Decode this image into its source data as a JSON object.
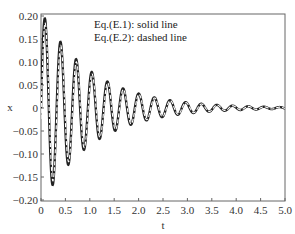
{
  "chart_data": {
    "type": "line",
    "title": "",
    "xlabel": "t",
    "ylabel": "x",
    "xlim": [
      0,
      5.0
    ],
    "ylim": [
      -0.2,
      0.2
    ],
    "x_ticks": [
      "0",
      "0.5",
      "1.0",
      "1.5",
      "2.0",
      "2.5",
      "3.0",
      "3.5",
      "4.0",
      "4.5",
      "5.0"
    ],
    "y_ticks": [
      "0.20",
      "0.15",
      "0.10",
      "0.05",
      "0",
      "−0.05",
      "−0.10",
      "−0.15",
      "−0.20"
    ],
    "grid": false,
    "legend_position": "top-center (text annotation)",
    "annotations": [
      "Eq.(E.1): solid line",
      "Eq.(E.2): dashed line"
    ],
    "series": [
      {
        "name": "Eq.(E.1)",
        "style": "solid",
        "model": "x(t) = A*exp(-zeta*t)*sin(omega*t)",
        "A": 0.21,
        "zeta": 0.95,
        "omega": 19.6,
        "key_points": [
          [
            0,
            0
          ],
          [
            0.08,
            0.185
          ],
          [
            0.25,
            -0.16
          ],
          [
            0.4,
            0.135
          ],
          [
            0.57,
            -0.115
          ],
          [
            0.73,
            0.1
          ],
          [
            0.89,
            -0.085
          ],
          [
            1.05,
            0.07
          ],
          [
            1.21,
            -0.06
          ],
          [
            1.37,
            0.05
          ],
          [
            1.53,
            -0.045
          ],
          [
            1.7,
            0.037
          ],
          [
            2.5,
            0.015
          ],
          [
            3.5,
            0.005
          ],
          [
            5.0,
            0.001
          ]
        ]
      },
      {
        "name": "Eq.(E.2)",
        "style": "dashed",
        "model": "x(t) = A*exp(-zeta*t)*sin(omega*t + phase)",
        "A": 0.2,
        "zeta": 0.95,
        "omega": 19.6,
        "phase": -0.12
      }
    ]
  },
  "legend": {
    "line1": "Eq.(E.1): solid line",
    "line2": "Eq.(E.2): dashed line"
  },
  "axes": {
    "xlabel": "t",
    "ylabel": "x"
  }
}
